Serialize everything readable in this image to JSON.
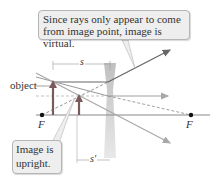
{
  "callouts": {
    "virtual": "Since rays only appear to come from image point, image is virtual.",
    "upright_line1": "Image is",
    "upright_line2": "upright."
  },
  "labels": {
    "object": "object",
    "focal_left": "F",
    "focal_right": "F",
    "object_distance": "s",
    "image_distance": "s′"
  },
  "colors": {
    "axis": "#888888",
    "ray": "#777777",
    "ray_light": "#a8a8a8",
    "object_arrow": "#7a5a5a",
    "lens": "#c8c8c8",
    "callout_bg": "#eeeeee"
  }
}
